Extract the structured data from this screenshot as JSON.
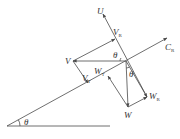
{
  "diagram": {
    "type": "vector-diagram",
    "colors": {
      "line": "#4a4a4a",
      "text": "#333333",
      "background": "#ffffff"
    },
    "labels": {
      "U": "U",
      "V": "V",
      "VR": {
        "main": "V",
        "sub": "R"
      },
      "VT": {
        "main": "V",
        "sub": "T"
      },
      "CR": {
        "main": "C",
        "sub": "R"
      },
      "W": "W",
      "WT": {
        "main": "W",
        "sub": "T"
      },
      "WR": {
        "main": "W",
        "sub": "R"
      },
      "theta_incline": "θ",
      "theta_top": "θ",
      "theta_right": "θ"
    },
    "points": {
      "O": [
        126,
        61
      ],
      "U_tip": [
        103,
        14
      ],
      "VR": [
        115,
        39
      ],
      "CR_tip": [
        167,
        38
      ],
      "V": [
        73,
        61
      ],
      "VT": [
        88,
        83
      ],
      "W": [
        128,
        107
      ],
      "WR": [
        147,
        97
      ],
      "WT": [
        108,
        76
      ],
      "incline_origin": [
        7,
        126
      ],
      "horizontal_end": [
        110,
        126
      ]
    }
  }
}
